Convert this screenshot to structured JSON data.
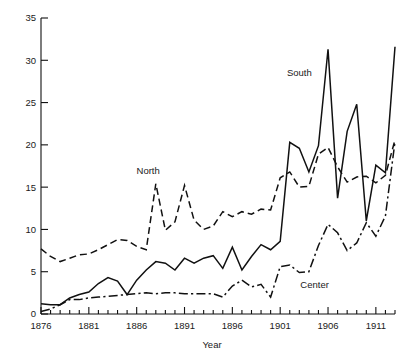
{
  "chart_data": {
    "type": "line",
    "title": "",
    "xlabel": "Year",
    "ylabel": "",
    "xlim": [
      1876,
      1913
    ],
    "ylim": [
      0,
      35
    ],
    "yticks": [
      0,
      5,
      10,
      15,
      20,
      25,
      30,
      35
    ],
    "ytick_labels": [
      "0",
      "5",
      "10",
      "15",
      "20",
      "25",
      "30",
      "35"
    ],
    "xticks": [
      1876,
      1881,
      1886,
      1891,
      1896,
      1901,
      1906,
      1911
    ],
    "xtick_labels": [
      "1876",
      "1881",
      "1886",
      "1891",
      "1896",
      "1901",
      "1906",
      "1911"
    ],
    "x_minor_tick_interval": 1,
    "grid": false,
    "legend_position": "inline-annotations",
    "x": [
      1876,
      1877,
      1878,
      1879,
      1880,
      1881,
      1882,
      1883,
      1884,
      1885,
      1886,
      1887,
      1888,
      1889,
      1890,
      1891,
      1892,
      1893,
      1894,
      1895,
      1896,
      1897,
      1898,
      1899,
      1900,
      1901,
      1902,
      1903,
      1904,
      1905,
      1906,
      1907,
      1908,
      1909,
      1910,
      1911,
      1912,
      1913
    ],
    "series": [
      {
        "name": "North",
        "line_style": "dashed",
        "color": "#111111",
        "label_x": 1887.2,
        "label_y": 16.6,
        "values": [
          7.7,
          6.8,
          6.2,
          6.6,
          7.0,
          7.1,
          7.6,
          8.2,
          8.8,
          8.7,
          8.0,
          7.6,
          15.4,
          9.9,
          10.9,
          15.2,
          11.1,
          10.0,
          10.4,
          12.1,
          11.5,
          12.1,
          11.8,
          12.4,
          12.3,
          16.1,
          16.8,
          15.0,
          15.1,
          18.9,
          19.7,
          17.4,
          15.6,
          16.2,
          16.3,
          15.5,
          16.4,
          20.6
        ]
      },
      {
        "name": "South",
        "line_style": "solid",
        "color": "#111111",
        "label_x": 1903.0,
        "label_y": 28.2,
        "values": [
          1.2,
          1.1,
          1.1,
          1.9,
          2.3,
          2.6,
          3.6,
          4.3,
          3.9,
          2.3,
          4.0,
          5.2,
          6.2,
          6.0,
          5.2,
          6.6,
          6.0,
          6.6,
          6.9,
          5.4,
          7.9,
          5.2,
          6.8,
          8.2,
          7.6,
          8.6,
          20.3,
          19.6,
          16.8,
          19.9,
          31.3,
          13.7,
          21.6,
          24.8,
          11.0,
          17.6,
          16.7,
          31.6
        ]
      },
      {
        "name": "Center",
        "line_style": "dashdot",
        "color": "#111111",
        "label_x": 1904.6,
        "label_y": 3.1,
        "values": [
          0.3,
          0.6,
          1.1,
          1.7,
          1.7,
          1.9,
          2.0,
          2.1,
          2.2,
          2.3,
          2.4,
          2.5,
          2.4,
          2.5,
          2.5,
          2.4,
          2.4,
          2.4,
          2.4,
          2.0,
          3.3,
          4.0,
          3.2,
          3.5,
          2.0,
          5.6,
          5.8,
          4.9,
          5.0,
          8.1,
          10.6,
          9.6,
          7.5,
          8.4,
          10.8,
          9.2,
          11.6,
          20.4
        ]
      }
    ]
  }
}
